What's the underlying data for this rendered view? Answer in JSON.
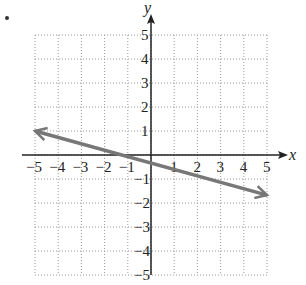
{
  "chart_data": {
    "type": "line",
    "title": "",
    "xlabel": "x",
    "ylabel": "y",
    "xlim": [
      -5,
      5
    ],
    "ylim": [
      -5,
      5
    ],
    "grid": true,
    "x_ticks": [
      "-5",
      "-4",
      "-3",
      "-2",
      "-1",
      "1",
      "2",
      "3",
      "4",
      "5"
    ],
    "y_ticks": [
      "5",
      "4",
      "3",
      "2",
      "1",
      "-1",
      "-2",
      "-3",
      "-4",
      "-5"
    ],
    "series": [
      {
        "name": "line",
        "x": [
          -5,
          5
        ],
        "y": [
          1,
          -1.67
        ],
        "arrows_both_ends": true,
        "color": "#777777"
      }
    ]
  }
}
